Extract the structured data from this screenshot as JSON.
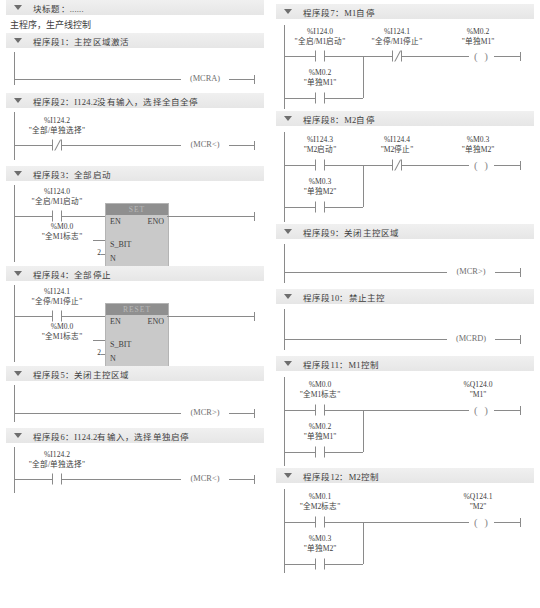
{
  "block": {
    "title": "块标题：......",
    "subtitle": "主程序，生产线控制"
  },
  "symbols": {
    "set_block": "SET",
    "reset_block": "RESET",
    "en": "EN",
    "eno": "ENO",
    "s_bit": "S_BIT",
    "n": "N"
  },
  "networks": [
    {
      "id": "nw1",
      "header": "程序段1：主控区域激活",
      "elements": {
        "coil": {
          "text": "(MCRA)"
        }
      }
    },
    {
      "id": "nw2",
      "header": "程序段2：I124.2没有输入，选择全自全停",
      "elements": {
        "contact1": {
          "addr": "%I124.2",
          "comment": "\"全部/单独选择\"",
          "type": "nc"
        },
        "coil": {
          "text": "(MCR<)"
        }
      }
    },
    {
      "id": "nw3",
      "header": "程序段3：全部启动",
      "elements": {
        "contact1": {
          "addr": "%I124.0",
          "comment": "\"全启/M1启动\"",
          "type": "no"
        },
        "block": {
          "name": "SET"
        },
        "sbit_operand": {
          "addr": "%M0.0",
          "comment": "\"全M1标志\""
        },
        "n_operand": {
          "value": "2"
        }
      }
    },
    {
      "id": "nw4",
      "header": "程序段4：全部停止",
      "elements": {
        "contact1": {
          "addr": "%I124.1",
          "comment": "\"全停/M1停止\"",
          "type": "no"
        },
        "block": {
          "name": "RESET"
        },
        "sbit_operand": {
          "addr": "%M0.0",
          "comment": "\"全M1标志\""
        },
        "n_operand": {
          "value": "2"
        }
      }
    },
    {
      "id": "nw5",
      "header": "程序段5：关闭主控区域",
      "elements": {
        "coil": {
          "text": "(MCR>)"
        }
      }
    },
    {
      "id": "nw6",
      "header": "程序段6：I124.2有输入，选择单独启停",
      "elements": {
        "contact1": {
          "addr": "%I124.2",
          "comment": "\"全部/单独选择\"",
          "type": "no"
        },
        "coil": {
          "text": "(MCR<)"
        }
      }
    },
    {
      "id": "nw7",
      "header": "程序段7：M1自停",
      "elements": {
        "contact1": {
          "addr": "%I124.0",
          "comment": "\"全启/M1启动\"",
          "type": "no"
        },
        "contact2": {
          "addr": "%I124.1",
          "comment": "\"全停/M1停止\"",
          "type": "nc"
        },
        "branch1": {
          "addr": "%M0.2",
          "comment": "\"单独M1\"",
          "type": "no"
        },
        "coil": {
          "addr": "%M0.2",
          "comment": "\"单独M1\""
        }
      }
    },
    {
      "id": "nw8",
      "header": "程序段8：M2自停",
      "elements": {
        "contact1": {
          "addr": "%I124.3",
          "comment": "\"M2启动\"",
          "type": "no"
        },
        "contact2": {
          "addr": "%I124.4",
          "comment": "\"M2停止\"",
          "type": "nc"
        },
        "branch1": {
          "addr": "%M0.3",
          "comment": "\"单独M2\"",
          "type": "no"
        },
        "coil": {
          "addr": "%M0.3",
          "comment": "\"单独M2\""
        }
      }
    },
    {
      "id": "nw9",
      "header": "程序段9：关闭主控区域",
      "elements": {
        "coil": {
          "text": "(MCR>)"
        }
      }
    },
    {
      "id": "nw10",
      "header": "程序段10：禁止主控",
      "elements": {
        "coil": {
          "text": "(MCRD)"
        }
      }
    },
    {
      "id": "nw11",
      "header": "程序段11：M1控制",
      "elements": {
        "contact1": {
          "addr": "%M0.0",
          "comment": "\"全M1标志\"",
          "type": "no"
        },
        "branch1": {
          "addr": "%M0.2",
          "comment": "\"单独M1\"",
          "type": "no"
        },
        "coil": {
          "addr": "%Q124.0",
          "comment": "\"M1\""
        }
      }
    },
    {
      "id": "nw12",
      "header": "程序段12：M2控制",
      "elements": {
        "contact1": {
          "addr": "%M0.1",
          "comment": "\"全M2标志\"",
          "type": "no"
        },
        "branch1": {
          "addr": "%M0.3",
          "comment": "\"单独M2\"",
          "type": "no"
        },
        "coil": {
          "addr": "%Q124.1",
          "comment": "\"M2\""
        }
      }
    }
  ],
  "colors": {
    "wire": "#8a8a8a",
    "header_bar": "#ebebeb",
    "block_header": "#8f8f8f",
    "block_body": "#c9c9c9",
    "text": "#3d3d3d"
  }
}
